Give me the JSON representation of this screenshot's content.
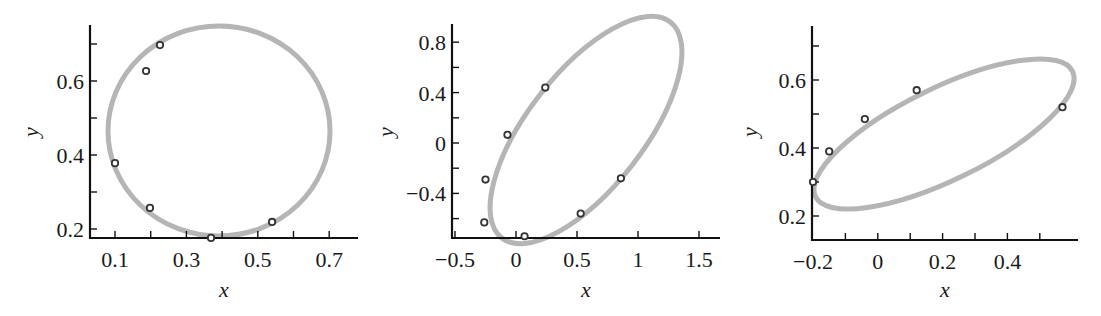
{
  "figure": {
    "panels": [
      {
        "id": "panel-1",
        "xlabel": "x",
        "ylabel": "y",
        "xlim": [
          0.03,
          0.78
        ],
        "ylim": [
          0.175,
          0.76
        ],
        "xticks_major": [
          0.1,
          0.3,
          0.5,
          0.7
        ],
        "xtick_labels": [
          "0.1",
          "0.3",
          "0.5",
          "0.7"
        ],
        "xticks_minor": [
          0.2,
          0.4,
          0.6
        ],
        "yticks_major": [
          0.2,
          0.4,
          0.6
        ],
        "ytick_labels": [
          "0.2",
          "0.4",
          "0.6"
        ],
        "yticks_minor": [
          0.3,
          0.5,
          0.7
        ]
      },
      {
        "id": "panel-2",
        "xlabel": "x",
        "ylabel": "y",
        "xlim": [
          -0.6,
          1.66
        ],
        "ylim": [
          -0.76,
          0.94
        ],
        "xticks_major": [
          -0.5,
          0,
          0.5,
          1,
          1.5
        ],
        "xtick_labels": [
          "−0.5",
          "0",
          "0.5",
          "1",
          "1.5"
        ],
        "yticks_major": [
          0.8,
          0.4,
          0,
          -0.4
        ],
        "ytick_labels": [
          "0.8",
          "0.4",
          "0",
          "−0.4"
        ],
        "yticks_minor": [
          0.6,
          0.2,
          -0.2,
          -0.6
        ]
      },
      {
        "id": "panel-3",
        "xlabel": "x",
        "ylabel": "y",
        "xlim": [
          -0.2,
          0.61
        ],
        "ylim": [
          0.13,
          0.76
        ],
        "xticks_major": [
          -0.2,
          0,
          0.2,
          0.4
        ],
        "xtick_labels": [
          "−0.2",
          "0",
          "0.2",
          "0.4"
        ],
        "xticks_minor": [
          -0.1,
          0.1,
          0.3,
          0.5
        ],
        "yticks_major": [
          0.2,
          0.4,
          0.6
        ],
        "ytick_labels": [
          "0.2",
          "0.4",
          "0.6"
        ],
        "yticks_minor": [
          0.3,
          0.5,
          0.7
        ]
      }
    ],
    "colors": {
      "curve": "#b5b5b5",
      "marker_edge": "#333333",
      "axis": "#111111"
    }
  },
  "chart_data": [
    {
      "type": "scatter",
      "title": "",
      "xlabel": "x",
      "ylabel": "y",
      "xlim": [
        0.03,
        0.78
      ],
      "ylim": [
        0.175,
        0.76
      ],
      "grid": false,
      "series": [
        {
          "name": "data points",
          "style": "open circle markers",
          "x": [
            0.226,
            0.187,
            0.1,
            0.198,
            0.369,
            0.54
          ],
          "y": [
            0.697,
            0.627,
            0.378,
            0.257,
            0.176,
            0.219
          ]
        },
        {
          "name": "fitted ellipse",
          "style": "gray closed curve",
          "center": [
            0.39,
            0.465
          ],
          "x_range": [
            0.08,
            0.7
          ],
          "y_range": [
            0.185,
            0.75
          ]
        }
      ]
    },
    {
      "type": "scatter",
      "title": "",
      "xlabel": "x",
      "ylabel": "y",
      "xlim": [
        -0.6,
        1.66
      ],
      "ylim": [
        -0.76,
        0.94
      ],
      "grid": false,
      "series": [
        {
          "name": "data points",
          "style": "open circle markers",
          "x": [
            0.24,
            -0.07,
            -0.25,
            -0.26,
            0.07,
            0.53,
            0.86
          ],
          "y": [
            0.44,
            0.065,
            -0.29,
            -0.63,
            -0.74,
            -0.56,
            -0.28
          ]
        },
        {
          "name": "fitted ellipse",
          "style": "gray closed curve",
          "center": [
            0.57,
            0.1
          ],
          "x_range": [
            -0.28,
            1.39
          ],
          "y_range": [
            -0.77,
            0.94
          ]
        }
      ]
    },
    {
      "type": "scatter",
      "title": "",
      "xlabel": "x",
      "ylabel": "y",
      "xlim": [
        -0.2,
        0.61
      ],
      "ylim": [
        0.13,
        0.76
      ],
      "grid": false,
      "series": [
        {
          "name": "data points",
          "style": "open circle markers",
          "x": [
            -0.2,
            -0.15,
            -0.04,
            0.12,
            0.57
          ],
          "y": [
            0.3,
            0.39,
            0.485,
            0.57,
            0.52
          ]
        },
        {
          "name": "fitted ellipse",
          "style": "gray closed curve",
          "center": [
            0.2,
            0.445
          ],
          "x_range": [
            -0.2,
            0.605
          ],
          "y_range": [
            0.225,
            0.67
          ]
        }
      ]
    }
  ]
}
